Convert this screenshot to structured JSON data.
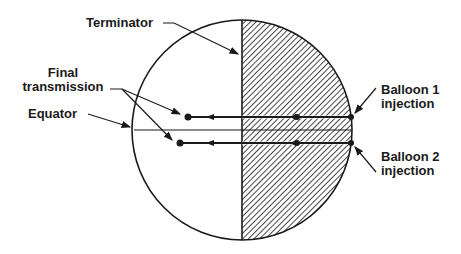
{
  "labels": {
    "terminator": "Terminator",
    "final_transmission_1": "Final",
    "final_transmission_2": "transmission",
    "equator": "Equator",
    "balloon1_1": "Balloon 1",
    "balloon1_2": "injection",
    "balloon2_1": "Balloon 2",
    "balloon2_2": "injection"
  },
  "colors": {
    "ink": "#1a1a1a",
    "background": "#ffffff"
  }
}
